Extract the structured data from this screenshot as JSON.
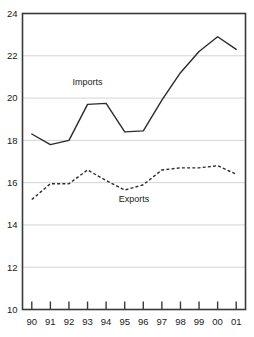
{
  "chart_data": {
    "type": "line",
    "title": "",
    "subtitle": "",
    "xlabel": "",
    "ylabel": "",
    "x": [
      "90",
      "91",
      "92",
      "93",
      "94",
      "95",
      "96",
      "97",
      "98",
      "99",
      "00",
      "01"
    ],
    "categories": [
      "90",
      "91",
      "92",
      "93",
      "94",
      "95",
      "96",
      "97",
      "98",
      "99",
      "00",
      "01"
    ],
    "ylim": [
      10,
      24
    ],
    "yticks": [
      10,
      12,
      14,
      16,
      18,
      20,
      22,
      24
    ],
    "ytick_labels": [
      "10",
      "12",
      "14",
      "16",
      "18",
      "20",
      "22",
      "24"
    ],
    "xtick_labels": [
      "90",
      "91",
      "92",
      "93",
      "94",
      "95",
      "96",
      "97",
      "98",
      "99",
      "00",
      "01"
    ],
    "grid": "horizontal",
    "legend_position": "inline-annotation",
    "series": [
      {
        "name": "Imports",
        "style": "solid",
        "color": "#2b2b2b",
        "values": [
          18.3,
          17.8,
          18.0,
          19.7,
          19.75,
          18.4,
          18.45,
          19.9,
          21.2,
          22.2,
          22.9,
          22.3
        ]
      },
      {
        "name": "Exports",
        "style": "dashed",
        "color": "#2b2b2b",
        "values": [
          15.2,
          15.95,
          15.95,
          16.6,
          16.1,
          15.65,
          15.9,
          16.6,
          16.7,
          16.7,
          16.8,
          16.4
        ]
      }
    ],
    "annotations": [
      {
        "text": "Imports",
        "x_value": 93,
        "y_value": 20.6
      },
      {
        "text": "Exports",
        "x_value": 95.5,
        "y_value": 15.1
      }
    ]
  },
  "axis": {
    "y_labels": [
      "24",
      "22",
      "20",
      "18",
      "16",
      "14",
      "12",
      "10"
    ],
    "x_labels": [
      "90",
      "91",
      "92",
      "93",
      "94",
      "95",
      "96",
      "97",
      "98",
      "99",
      "00",
      "01"
    ]
  },
  "labels": {
    "imports": "Imports",
    "exports": "Exports"
  },
  "colors": {
    "line": "#2b2b2b",
    "grid": "#c9c9c9",
    "frame": "#3a3a3a",
    "background": "#ffffff"
  }
}
